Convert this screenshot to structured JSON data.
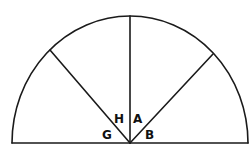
{
  "diagram": {
    "type": "semicircle-with-radii",
    "labels": {
      "H": "H",
      "A": "A",
      "G": "G",
      "B": "B"
    },
    "colors": {
      "line": "#1a1a1a",
      "background": "#ffffff",
      "text": "#111111"
    }
  }
}
